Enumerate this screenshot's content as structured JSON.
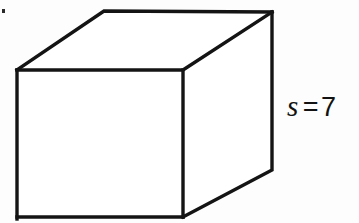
{
  "figure": {
    "name": "cube-diagram",
    "shape": "cube",
    "background_color": "#fdfdfd",
    "line_color": "#141414",
    "face_color": "#ffffff",
    "label": {
      "variable": "s",
      "operator": "=",
      "value": "7",
      "full_text": "s = 7",
      "position": "right-of-cube"
    },
    "geometry": {
      "front_face": "17,70 183,70 183,217 17,217",
      "top_face": "17,70 104,11 272,12 183,70",
      "right_face": "183,70 272,12 272,170 183,217",
      "vertices": {
        "front_top_left": "17,70",
        "front_top_right": "183,70",
        "front_bottom_left": "17,217",
        "front_bottom_right": "183,217",
        "back_top_left": "104,11",
        "back_top_right": "272,12",
        "back_bottom_right": "272,170"
      }
    },
    "artifacts": {
      "speck": "small dark speck, upper-left corner"
    }
  }
}
